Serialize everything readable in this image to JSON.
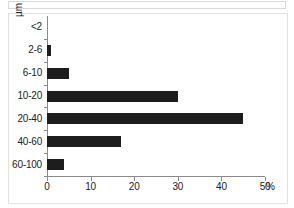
{
  "chart_data": {
    "type": "bar",
    "orientation": "horizontal",
    "title": "",
    "xlabel": "%",
    "ylabel": "µm",
    "categories": [
      "<2",
      "2-6",
      "6-10",
      "10-20",
      "20-40",
      "40-60",
      "60-100"
    ],
    "values": [
      0,
      1,
      5,
      30,
      45,
      17,
      4
    ],
    "xlim": [
      0,
      50
    ],
    "xticks": [
      0,
      10,
      20,
      30,
      40,
      50
    ],
    "xtick_labels": [
      "0",
      "10",
      "20",
      "30",
      "40",
      "50"
    ],
    "x_unit_suffix": "%",
    "grid": false,
    "legend": null,
    "bar_color": "#1d1d1d",
    "axis_color": "#8a8a8a",
    "background": "#ffffff"
  },
  "axes": {
    "y_title": "µm",
    "x_unit": "%"
  }
}
